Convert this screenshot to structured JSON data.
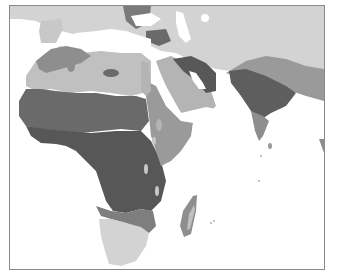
{
  "map": {
    "title": "",
    "region": "Africa, Middle East and South Asia",
    "shade_colors": {
      "water": "#ffffff",
      "lightest": "#d3d3d3",
      "light": "#b4b4b4",
      "medium": "#8e8e8e",
      "dark": "#6a6a6a",
      "darkest": "#555555",
      "border": "#8a8a8a"
    }
  }
}
